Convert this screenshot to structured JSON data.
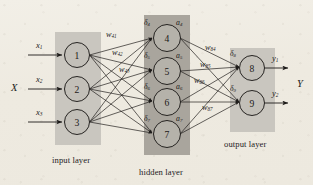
{
  "figure": {
    "background_color": "#efece3",
    "ink_color": "#1d1b19"
  },
  "layers": [
    {
      "id": "input",
      "caption": "input layer",
      "box": {
        "x": 55,
        "y": 32,
        "w": 46,
        "h": 113,
        "fill": "#c9c6bf"
      },
      "nodes": [
        {
          "label": "1",
          "cx": 77,
          "cy": 55,
          "r": 12.5
        },
        {
          "label": "2",
          "cx": 77,
          "cy": 89,
          "r": 12.5
        },
        {
          "label": "3",
          "cx": 77,
          "cy": 122,
          "r": 12.5
        }
      ]
    },
    {
      "id": "hidden",
      "caption": "hidden layer",
      "box": {
        "x": 144,
        "y": 15,
        "w": 46,
        "h": 140,
        "fill": "#a9a59d"
      },
      "nodes": [
        {
          "label": "4",
          "cx": 167,
          "cy": 38,
          "r": 13.5
        },
        {
          "label": "5",
          "cx": 167,
          "cy": 71,
          "r": 13.5
        },
        {
          "label": "6",
          "cx": 167,
          "cy": 102,
          "r": 13.5
        },
        {
          "label": "7",
          "cx": 167,
          "cy": 134,
          "r": 13.5
        }
      ]
    },
    {
      "id": "output",
      "caption": "output layer",
      "box": {
        "x": 230,
        "y": 48,
        "w": 45,
        "h": 84,
        "fill": "#c9c6bf"
      },
      "nodes": [
        {
          "label": "8",
          "cx": 252,
          "cy": 68,
          "r": 12.5
        },
        {
          "label": "9",
          "cx": 252,
          "cy": 103,
          "r": 12.5
        }
      ]
    }
  ],
  "inputs": {
    "bundle_label": "X",
    "signals": [
      {
        "base": "x",
        "sub": "1"
      },
      {
        "base": "x",
        "sub": "2"
      },
      {
        "base": "x",
        "sub": "3"
      }
    ]
  },
  "outputs": {
    "bundle_label": "Y",
    "signals": [
      {
        "base": "y",
        "sub": "1"
      },
      {
        "base": "y",
        "sub": "2"
      }
    ]
  },
  "weights_input_hidden": [
    {
      "base": "w",
      "sub": "41"
    },
    {
      "base": "w",
      "sub": "42"
    },
    {
      "base": "w",
      "sub": "43"
    }
  ],
  "weights_hidden_output": [
    {
      "base": "w",
      "sub": "84"
    },
    {
      "base": "w",
      "sub": "85"
    },
    {
      "base": "w",
      "sub": "86"
    },
    {
      "base": "w",
      "sub": "87"
    }
  ],
  "deltas_hidden": [
    {
      "base": "δ",
      "sub": "4"
    },
    {
      "base": "δ",
      "sub": "5"
    },
    {
      "base": "δ",
      "sub": "6"
    },
    {
      "base": "δ",
      "sub": "7"
    }
  ],
  "deltas_output": [
    {
      "base": "δ",
      "sub": "8"
    },
    {
      "base": "δ",
      "sub": "9"
    }
  ],
  "activations_hidden": [
    {
      "base": "a",
      "sub": "4"
    },
    {
      "base": "a",
      "sub": "5"
    },
    {
      "base": "a",
      "sub": "6"
    },
    {
      "base": "a",
      "sub": "7"
    }
  ],
  "captions": {
    "input": "input layer",
    "hidden": "hidden layer",
    "output": "output layer"
  }
}
